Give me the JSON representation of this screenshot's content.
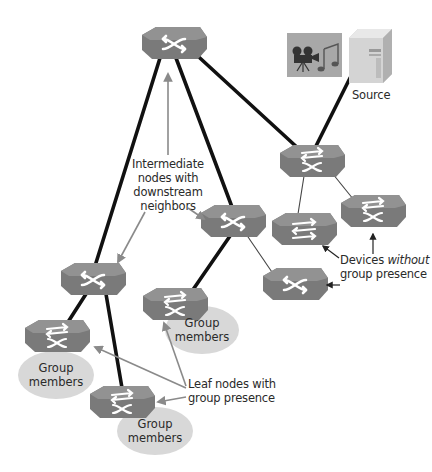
{
  "diagram": {
    "title": "",
    "colors": {
      "switch_fill": "#7c7c7c",
      "switch_top": "#8f8f8f",
      "switch_icon": "#ffffff",
      "link_thick": "#111111",
      "link_thin": "#333333",
      "annotation_arrow": "#8a8a8a",
      "group_ellipse": "#d9d9d9",
      "text": "#2a2a2a"
    },
    "nodes": [
      {
        "id": "root",
        "type": "switch",
        "icon": "crossed-arrows-icon"
      },
      {
        "id": "source-switch",
        "type": "l3-switch",
        "icon": "bidirectional-crossed-arrows-icon"
      },
      {
        "id": "intermediate-mid",
        "type": "switch",
        "icon": "crossed-arrows-icon"
      },
      {
        "id": "intermediate-left",
        "type": "switch",
        "icon": "crossed-arrows-icon"
      },
      {
        "id": "leaf-left",
        "type": "l3-switch",
        "icon": "bidirectional-crossed-arrows-icon"
      },
      {
        "id": "leaf-bottom",
        "type": "l3-switch",
        "icon": "bidirectional-crossed-arrows-icon"
      },
      {
        "id": "leaf-mid",
        "type": "l3-switch",
        "icon": "bidirectional-crossed-arrows-icon"
      },
      {
        "id": "device-no-group-1",
        "type": "router",
        "icon": "bidirectional-arrows-icon"
      },
      {
        "id": "device-no-group-2",
        "type": "l3-switch",
        "icon": "bidirectional-crossed-arrows-icon"
      },
      {
        "id": "device-no-group-3",
        "type": "switch",
        "icon": "crossed-arrows-icon"
      },
      {
        "id": "source",
        "type": "server",
        "icon": "server-icon"
      },
      {
        "id": "media",
        "type": "media",
        "icon": "video-camera-music-icon"
      }
    ],
    "labels": {
      "source": "Source",
      "intermediate": [
        "Intermediate",
        "nodes with",
        "downstream",
        "neighbors"
      ],
      "devices_without": {
        "line1_prefix": "Devices ",
        "line1_italic": "without",
        "line2": "group presence"
      },
      "leaf_nodes": [
        "Leaf nodes with",
        "group presence"
      ],
      "group_members": [
        "Group",
        "members"
      ]
    },
    "group_member_clouds": [
      {
        "attached_to": "leaf-mid",
        "line1": "Group",
        "line2": "members"
      },
      {
        "attached_to": "leaf-left",
        "line1": "Group",
        "line2": "members"
      },
      {
        "attached_to": "leaf-bottom",
        "line1": "Group",
        "line2": "members"
      }
    ]
  }
}
